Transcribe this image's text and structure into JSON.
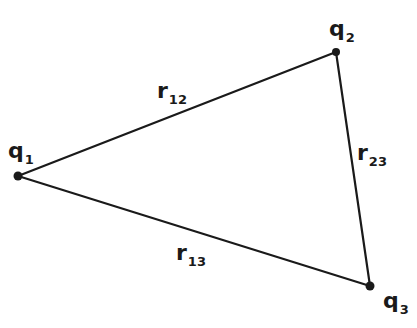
{
  "diagram": {
    "type": "triangle",
    "stroke_color": "#1a1a1a",
    "background": "#ffffff",
    "vertices": [
      {
        "id": "q1",
        "symbol": "q",
        "subscript": "1",
        "x": 18,
        "y": 176
      },
      {
        "id": "q2",
        "symbol": "q",
        "subscript": "2",
        "x": 336,
        "y": 52
      },
      {
        "id": "q3",
        "symbol": "q",
        "subscript": "3",
        "x": 370,
        "y": 286
      }
    ],
    "edges": [
      {
        "id": "r12",
        "from": "q1",
        "to": "q2",
        "symbol": "r",
        "subscript": "12"
      },
      {
        "id": "r23",
        "from": "q2",
        "to": "q3",
        "symbol": "r",
        "subscript": "23"
      },
      {
        "id": "r13",
        "from": "q1",
        "to": "q3",
        "symbol": "r",
        "subscript": "13"
      }
    ],
    "labels": {
      "q1": {
        "main": "q",
        "sub": "1"
      },
      "q2": {
        "main": "q",
        "sub": "2"
      },
      "q3": {
        "main": "q",
        "sub": "3"
      },
      "r12": {
        "main": "r",
        "sub": "12"
      },
      "r23": {
        "main": "r",
        "sub": "23"
      },
      "r13": {
        "main": "r",
        "sub": "13"
      }
    }
  }
}
